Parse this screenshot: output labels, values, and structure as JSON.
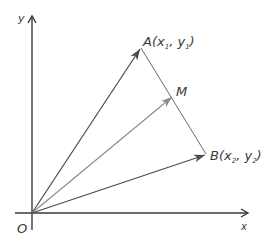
{
  "diagram": {
    "type": "vector-midpoint",
    "axes": {
      "x_label": "x",
      "y_label": "y",
      "origin_label": "O"
    },
    "points": {
      "A": {
        "name": "A",
        "x_sub": "1",
        "y_sub": "1"
      },
      "B": {
        "name": "B",
        "x_sub": "2",
        "y_sub": "2"
      },
      "M": {
        "name": "M"
      }
    },
    "label_parts": {
      "open": "(",
      "x": "x",
      "comma": ", ",
      "y": "y",
      "close": ")"
    },
    "vectors": [
      {
        "from": "O",
        "to": "A",
        "color": "#4a4a4a"
      },
      {
        "from": "O",
        "to": "M",
        "color": "#8a8a8a"
      },
      {
        "from": "O",
        "to": "B",
        "color": "#4a4a4a"
      }
    ],
    "segments": [
      {
        "from": "A",
        "to": "B",
        "color": "#6a6a6a"
      }
    ],
    "colors": {
      "axis": "#3a3a3a",
      "vector_dark": "#4a4a4a",
      "vector_light": "#8a8a8a",
      "segment": "#6a6a6a",
      "text": "#3a3a3a"
    }
  }
}
